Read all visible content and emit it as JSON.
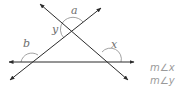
{
  "diagram": {
    "type": "geometry-angles",
    "lines": [
      {
        "name": "horizontal-line",
        "from": [
          8,
          62
        ],
        "to": [
          134,
          62
        ]
      },
      {
        "name": "rising-transversal",
        "from": [
          10,
          80
        ],
        "to": [
          101,
          8
        ]
      },
      {
        "name": "falling-transversal",
        "from": [
          40,
          4
        ],
        "to": [
          128,
          80
        ]
      }
    ],
    "angle_labels": [
      {
        "id": "a",
        "text": "a",
        "x": 71,
        "y": 14
      },
      {
        "id": "y",
        "text": "y",
        "x": 52,
        "y": 33
      },
      {
        "id": "b",
        "text": "b",
        "x": 23,
        "y": 47
      },
      {
        "id": "x",
        "text": "x",
        "x": 111,
        "y": 48
      }
    ],
    "stroke_color": "#2b2b2b",
    "arc_color": "#8a8a8a",
    "label_color": "#6e6e6e"
  },
  "measures": {
    "x": "m∠x",
    "y": "m∠y"
  }
}
